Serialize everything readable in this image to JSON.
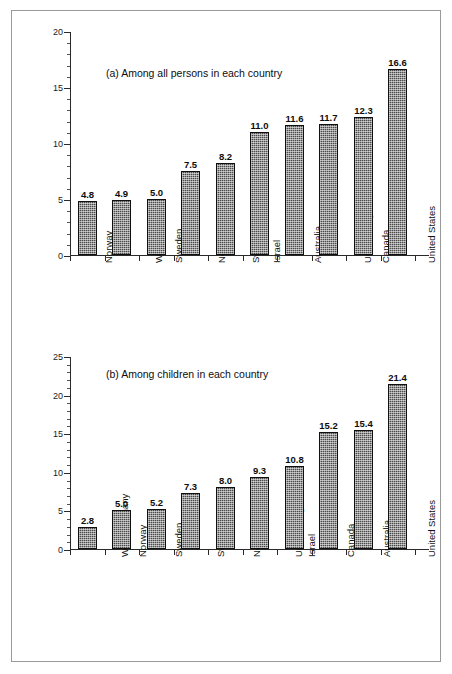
{
  "figure": {
    "background_color": "#ffffff",
    "frame_color": "#9a9a9a",
    "bar_fill_color": "#4a4a4a",
    "bar_outline_color": "#101010",
    "axis_color": "#2a2a2a"
  },
  "chart_data": [
    {
      "type": "bar",
      "title": "(a) Among all persons in each country",
      "xlabel": "",
      "ylabel": "",
      "ylim": [
        0,
        20
      ],
      "yticks": [
        0,
        5,
        10,
        15,
        20
      ],
      "ytick_labels": [
        "0",
        "5",
        "10",
        "15",
        "20"
      ],
      "minor_tick_interval": 1,
      "grid": false,
      "legend": "none",
      "data_labels": true,
      "categories": [
        "Norway",
        "West Germany",
        "Sweden",
        "Netherlands",
        "Switzerland",
        "Israel",
        "Australia",
        "United Kingdom",
        "Canada",
        "United States"
      ],
      "values": [
        4.8,
        4.9,
        5.0,
        7.5,
        8.2,
        11.0,
        11.6,
        11.7,
        12.3,
        16.6
      ],
      "value_labels": [
        "4.8",
        "4.9",
        "5.0",
        "7.5",
        "8.2",
        "11.0",
        "11.6",
        "11.7",
        "12.3",
        "16.6"
      ]
    },
    {
      "type": "bar",
      "title": "(b) Among children in each country",
      "xlabel": "",
      "ylabel": "",
      "ylim": [
        0,
        25
      ],
      "yticks": [
        0,
        5,
        10,
        15,
        20,
        25
      ],
      "ytick_labels": [
        "0",
        "5",
        "10",
        "15",
        "20",
        "25"
      ],
      "minor_tick_interval": 1,
      "grid": false,
      "legend": "none",
      "data_labels": true,
      "categories": [
        "West Germany",
        "Norway",
        "Sweden",
        "Switzerland",
        "Netherlands",
        "United Kingdom",
        "Israel",
        "Canada",
        "Australia",
        "United States"
      ],
      "values": [
        2.8,
        5.0,
        5.2,
        7.3,
        8.0,
        9.3,
        10.8,
        15.2,
        15.4,
        21.4
      ],
      "value_labels": [
        "2.8",
        "5.0",
        "5.2",
        "7.3",
        "8.0",
        "9.3",
        "10.8",
        "15.2",
        "15.4",
        "21.4"
      ]
    }
  ]
}
